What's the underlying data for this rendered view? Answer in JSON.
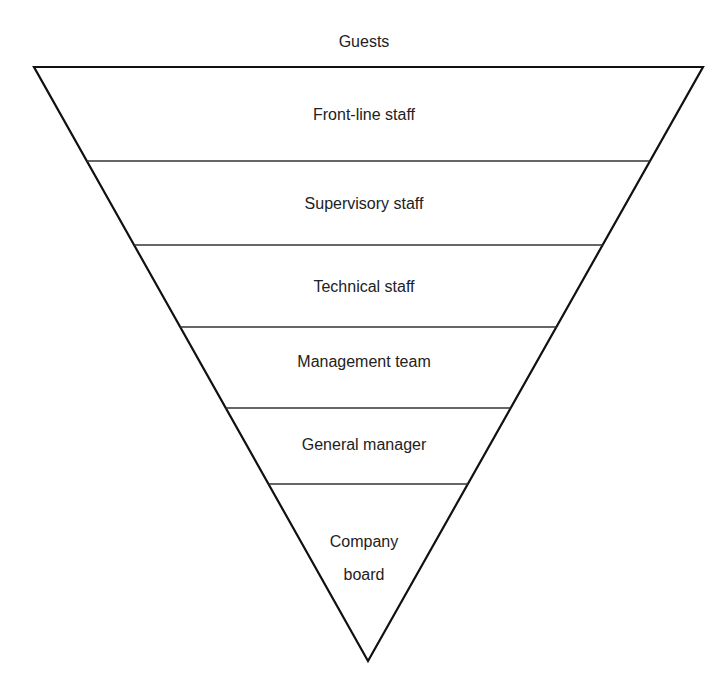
{
  "diagram": {
    "type": "inverted-pyramid",
    "title_above": "Guests",
    "levels": [
      {
        "label": "Front-line staff"
      },
      {
        "label": "Supervisory staff"
      },
      {
        "label": "Technical staff"
      },
      {
        "label": "Management team"
      },
      {
        "label": "General manager"
      },
      {
        "label_line1": "Company",
        "label_line2": "board"
      }
    ],
    "colors": {
      "outline": "#111111",
      "divider": "#333333",
      "text": "#222222",
      "background": "#ffffff"
    }
  }
}
